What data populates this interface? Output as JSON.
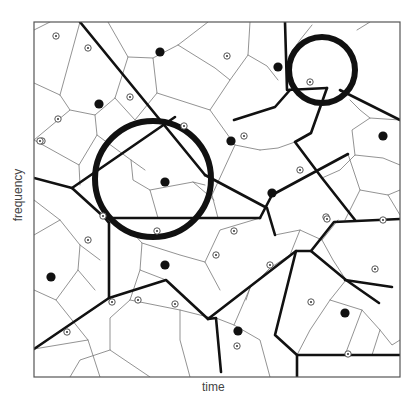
{
  "figure": {
    "type": "voronoi-diagram",
    "xlabel": "time",
    "ylabel": "frequency",
    "frame": {
      "x0": 34,
      "y0": 22,
      "x1": 400,
      "y1": 377
    },
    "colors": {
      "thin_edge": "#777777",
      "thick_edge": "#111111",
      "circle": "#111111",
      "frame": "#555555"
    }
  },
  "circles": [
    {
      "cx": 153,
      "cy": 179,
      "r": 58,
      "stroke_width": 6
    },
    {
      "cx": 322,
      "cy": 70,
      "r": 33,
      "stroke_width": 6
    }
  ],
  "filled_points": [
    [
      160,
      52
    ],
    [
      99,
      104
    ],
    [
      231,
      141
    ],
    [
      383,
      136
    ],
    [
      165,
      182
    ],
    [
      272,
      193
    ],
    [
      51,
      277
    ],
    [
      165,
      265
    ],
    [
      238,
      331
    ],
    [
      345,
      313
    ],
    [
      278,
      67
    ]
  ],
  "ringed_points": [
    [
      56,
      36
    ],
    [
      88,
      48
    ],
    [
      130,
      97
    ],
    [
      58,
      119
    ],
    [
      42,
      141
    ],
    [
      184,
      126
    ],
    [
      227,
      56
    ],
    [
      310,
      82
    ],
    [
      300,
      170
    ],
    [
      326,
      217
    ],
    [
      383,
      220
    ],
    [
      40,
      141
    ],
    [
      244,
      136
    ],
    [
      103,
      216
    ],
    [
      157,
      231
    ],
    [
      88,
      240
    ],
    [
      234,
      231
    ],
    [
      327,
      219
    ],
    [
      138,
      300
    ],
    [
      175,
      304
    ],
    [
      216,
      255
    ],
    [
      270,
      265
    ],
    [
      311,
      302
    ],
    [
      375,
      269
    ],
    [
      237,
      346
    ],
    [
      348,
      354
    ],
    [
      112,
      302
    ],
    [
      67,
      332
    ]
  ],
  "thick_edges": [
    [
      [
        80,
        22
      ],
      [
        205,
        175
      ]
    ],
    [
      [
        34,
        178
      ],
      [
        72,
        188
      ],
      [
        105,
        218
      ],
      [
        109,
        223
      ],
      [
        109,
        298
      ],
      [
        34,
        349
      ]
    ],
    [
      [
        72,
        188
      ],
      [
        175,
        117
      ]
    ],
    [
      [
        109,
        298
      ],
      [
        166,
        280
      ],
      [
        208,
        319
      ],
      [
        216,
        318
      ],
      [
        221,
        372
      ]
    ],
    [
      [
        105,
        218
      ],
      [
        260,
        218
      ]
    ],
    [
      [
        208,
        319
      ],
      [
        296,
        251
      ],
      [
        311,
        251
      ],
      [
        346,
        280
      ],
      [
        379,
        303
      ]
    ],
    [
      [
        260,
        218
      ],
      [
        272,
        195
      ],
      [
        348,
        154
      ]
    ],
    [
      [
        311,
        251
      ],
      [
        334,
        222
      ],
      [
        400,
        219
      ]
    ],
    [
      [
        205,
        175
      ],
      [
        267,
        208
      ],
      [
        275,
        235
      ]
    ],
    [
      [
        285,
        22
      ],
      [
        287,
        90
      ],
      [
        327,
        88
      ]
    ],
    [
      [
        327,
        88
      ],
      [
        311,
        133
      ],
      [
        295,
        142
      ],
      [
        322,
        178
      ],
      [
        355,
        220
      ]
    ],
    [
      [
        234,
        120
      ],
      [
        275,
        107
      ],
      [
        290,
        90
      ]
    ],
    [
      [
        296,
        251
      ],
      [
        275,
        335
      ],
      [
        297,
        355
      ],
      [
        297,
        377
      ]
    ],
    [
      [
        297,
        355
      ],
      [
        400,
        355
      ]
    ],
    [
      [
        340,
        90
      ],
      [
        400,
        120
      ]
    ],
    [
      [
        345,
        280
      ],
      [
        392,
        287
      ]
    ]
  ],
  "thin_edges": [
    [
      [
        34,
        83
      ],
      [
        60,
        95
      ],
      [
        70,
        110
      ],
      [
        34,
        140
      ]
    ],
    [
      [
        60,
        95
      ],
      [
        80,
        22
      ]
    ],
    [
      [
        70,
        110
      ],
      [
        95,
        115
      ],
      [
        115,
        98
      ],
      [
        128,
        57
      ],
      [
        108,
        22
      ]
    ],
    [
      [
        95,
        115
      ],
      [
        97,
        135
      ],
      [
        79,
        165
      ],
      [
        34,
        140
      ]
    ],
    [
      [
        97,
        135
      ],
      [
        131,
        160
      ],
      [
        145,
        170
      ]
    ],
    [
      [
        128,
        57
      ],
      [
        153,
        58
      ],
      [
        157,
        93
      ],
      [
        135,
        120
      ],
      [
        115,
        98
      ]
    ],
    [
      [
        153,
        58
      ],
      [
        178,
        45
      ],
      [
        208,
        22
      ]
    ],
    [
      [
        178,
        45
      ],
      [
        215,
        68
      ],
      [
        230,
        80
      ],
      [
        210,
        110
      ],
      [
        157,
        93
      ]
    ],
    [
      [
        230,
        80
      ],
      [
        248,
        55
      ],
      [
        250,
        22
      ]
    ],
    [
      [
        248,
        55
      ],
      [
        267,
        66
      ],
      [
        278,
        80
      ]
    ],
    [
      [
        210,
        110
      ],
      [
        235,
        145
      ],
      [
        260,
        150
      ]
    ],
    [
      [
        235,
        145
      ],
      [
        212,
        195
      ],
      [
        218,
        218
      ]
    ],
    [
      [
        79,
        165
      ],
      [
        80,
        185
      ]
    ],
    [
      [
        131,
        160
      ],
      [
        133,
        180
      ],
      [
        150,
        190
      ],
      [
        158,
        218
      ]
    ],
    [
      [
        150,
        190
      ],
      [
        193,
        182
      ],
      [
        205,
        185
      ]
    ],
    [
      [
        193,
        182
      ],
      [
        214,
        200
      ]
    ],
    [
      [
        34,
        200
      ],
      [
        60,
        220
      ],
      [
        80,
        245
      ],
      [
        100,
        260
      ]
    ],
    [
      [
        60,
        220
      ],
      [
        34,
        235
      ]
    ],
    [
      [
        80,
        245
      ],
      [
        78,
        270
      ],
      [
        56,
        300
      ],
      [
        34,
        290
      ]
    ],
    [
      [
        78,
        270
      ],
      [
        95,
        290
      ]
    ],
    [
      [
        56,
        300
      ],
      [
        88,
        340
      ],
      [
        100,
        377
      ]
    ],
    [
      [
        88,
        340
      ],
      [
        34,
        349
      ]
    ],
    [
      [
        130,
        230
      ],
      [
        142,
        243
      ],
      [
        140,
        270
      ],
      [
        166,
        280
      ]
    ],
    [
      [
        142,
        243
      ],
      [
        180,
        255
      ],
      [
        205,
        262
      ],
      [
        220,
        290
      ]
    ],
    [
      [
        205,
        262
      ],
      [
        220,
        230
      ],
      [
        260,
        218
      ]
    ],
    [
      [
        140,
        270
      ],
      [
        130,
        300
      ],
      [
        110,
        318
      ],
      [
        110,
        350
      ],
      [
        150,
        377
      ]
    ],
    [
      [
        130,
        300
      ],
      [
        180,
        310
      ],
      [
        212,
        318
      ]
    ],
    [
      [
        110,
        350
      ],
      [
        80,
        360
      ],
      [
        70,
        377
      ]
    ],
    [
      [
        180,
        310
      ],
      [
        180,
        340
      ],
      [
        190,
        377
      ]
    ],
    [
      [
        216,
        318
      ],
      [
        234,
        325
      ],
      [
        260,
        340
      ],
      [
        270,
        377
      ]
    ],
    [
      [
        234,
        325
      ],
      [
        250,
        288
      ],
      [
        270,
        268
      ],
      [
        296,
        251
      ]
    ],
    [
      [
        250,
        288
      ],
      [
        246,
        300
      ]
    ],
    [
      [
        275,
        235
      ],
      [
        300,
        230
      ],
      [
        322,
        240
      ],
      [
        333,
        260
      ],
      [
        346,
        280
      ]
    ],
    [
      [
        300,
        230
      ],
      [
        290,
        255
      ]
    ],
    [
      [
        322,
        240
      ],
      [
        338,
        220
      ]
    ],
    [
      [
        348,
        154
      ],
      [
        360,
        190
      ],
      [
        388,
        195
      ],
      [
        400,
        190
      ]
    ],
    [
      [
        360,
        190
      ],
      [
        345,
        220
      ]
    ],
    [
      [
        388,
        195
      ],
      [
        400,
        215
      ]
    ],
    [
      [
        346,
        280
      ],
      [
        330,
        300
      ],
      [
        310,
        330
      ],
      [
        297,
        355
      ]
    ],
    [
      [
        330,
        300
      ],
      [
        362,
        310
      ],
      [
        380,
        330
      ],
      [
        392,
        345
      ],
      [
        400,
        340
      ]
    ],
    [
      [
        380,
        330
      ],
      [
        372,
        355
      ]
    ],
    [
      [
        362,
        310
      ],
      [
        345,
        355
      ]
    ],
    [
      [
        322,
        178
      ],
      [
        340,
        170
      ],
      [
        355,
        155
      ],
      [
        383,
        158
      ],
      [
        400,
        165
      ]
    ],
    [
      [
        355,
        155
      ],
      [
        352,
        130
      ],
      [
        370,
        118
      ],
      [
        400,
        120
      ]
    ],
    [
      [
        295,
        142
      ],
      [
        278,
        148
      ],
      [
        260,
        150
      ]
    ],
    [
      [
        312,
        25
      ],
      [
        300,
        40
      ],
      [
        290,
        55
      ]
    ],
    [
      [
        357,
        30
      ],
      [
        370,
        22
      ]
    ],
    [
      [
        350,
        100
      ],
      [
        360,
        110
      ],
      [
        370,
        118
      ]
    ],
    [
      [
        34,
        30
      ],
      [
        50,
        22
      ]
    ]
  ]
}
